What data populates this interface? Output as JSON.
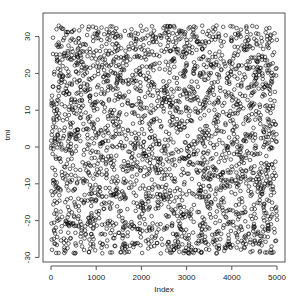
{
  "chart_data": {
    "type": "scatter",
    "title": "",
    "xlabel": "Index",
    "ylabel": "tmi",
    "xlim": [
      0,
      5000
    ],
    "ylim": [
      -30,
      33
    ],
    "x_ticks": [
      0,
      1000,
      2000,
      3000,
      4000,
      5000
    ],
    "y_ticks": [
      -30,
      -20,
      -10,
      0,
      10,
      20,
      30
    ],
    "grid": false,
    "legend": null,
    "marker": "open-circle",
    "n_points": 5000,
    "distribution": "approximately uniform random between -29 and 33 across index 1..5000",
    "point_color": "#000000"
  },
  "frame": {
    "box_color": "#555555"
  }
}
